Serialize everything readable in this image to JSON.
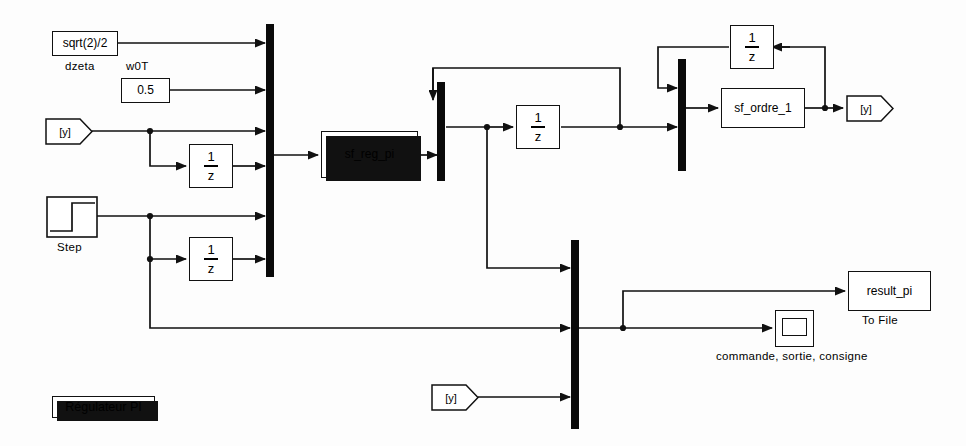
{
  "diagram": {
    "title": "Régulateur PI",
    "blocks": {
      "dzeta_const": {
        "value": "sqrt(2)/2",
        "label": "dzeta"
      },
      "w0t_const": {
        "value": "0.5",
        "label": "w0T"
      },
      "from_y_1": {
        "tag": "[y]"
      },
      "from_y_2": {
        "tag": "[y]"
      },
      "goto_y": {
        "tag": "[y]"
      },
      "step": {
        "label": "Step"
      },
      "delay_1": {
        "num": "1",
        "den": "z"
      },
      "delay_2": {
        "num": "1",
        "den": "z"
      },
      "delay_3": {
        "num": "1",
        "den": "z"
      },
      "delay_4": {
        "num": "1",
        "den": "z"
      },
      "reg_pi": {
        "name": "sf_reg_pi"
      },
      "ordre_1": {
        "name": "sf_ordre_1"
      },
      "to_file": {
        "name": "result_pi",
        "label": "To File"
      },
      "scope": {
        "label": "commande, sortie, consigne"
      }
    },
    "colors": {
      "line": "#111111",
      "block_border": "#111111",
      "mux_fill": "#0a0a0a",
      "background": "#fdfdfd"
    }
  }
}
